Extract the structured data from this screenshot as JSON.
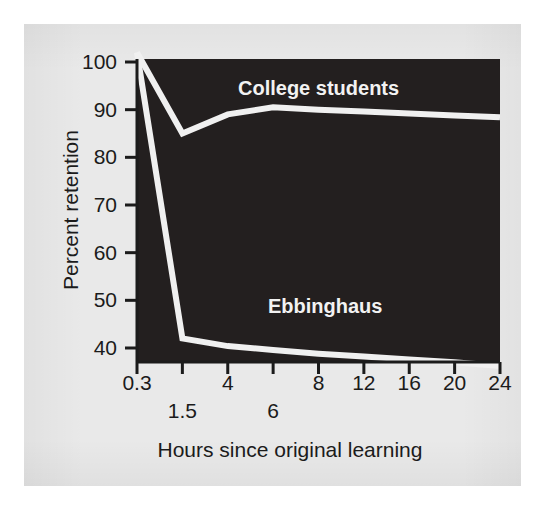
{
  "figure": {
    "background_color": "#ffffff",
    "panel_color": "#e9e9e9",
    "plot_background_color": "#231f1f",
    "line_color": "#f0f0f0",
    "text_color": "#1b1b1b"
  },
  "chart_data": {
    "type": "line",
    "title": "",
    "subtitle": "",
    "xlabel": "Hours since original learning",
    "ylabel": "Percent retention",
    "x": [
      0.3,
      1.5,
      4,
      6,
      8,
      12,
      16,
      20,
      24
    ],
    "xtick_labels": [
      "0.3",
      "1.5",
      "4",
      "6",
      "8",
      "12",
      "16",
      "20",
      "24"
    ],
    "xtick_rows": [
      0,
      1,
      0,
      1,
      0,
      0,
      0,
      0,
      0
    ],
    "ytick_labels": [
      "100",
      "90",
      "80",
      "70",
      "60",
      "50",
      "40"
    ],
    "ytick_values": [
      100,
      90,
      80,
      70,
      60,
      50,
      40
    ],
    "xlim": [
      0,
      8
    ],
    "ylim": [
      34,
      102
    ],
    "grid": false,
    "legend_position": "inline-annotation",
    "series": [
      {
        "name": "College students",
        "label": "College students",
        "color": "#f0f0f0",
        "values": [
          102,
          85,
          89,
          90.5,
          90,
          89.6,
          89.2,
          88.8,
          88.4
        ]
      },
      {
        "name": "Ebbinghaus",
        "label": "Ebbinghaus",
        "color": "#f0f0f0",
        "values": [
          102,
          42,
          40.4,
          39.6,
          38.8,
          38.2,
          37.6,
          37.0,
          36.2
        ]
      }
    ],
    "annotations": [
      {
        "text": "College students",
        "series": "College students",
        "x_index": 4,
        "y_value": 96
      },
      {
        "text": "Ebbinghaus",
        "series": "Ebbinghaus",
        "x_index": 4,
        "y_value": 46
      }
    ]
  }
}
